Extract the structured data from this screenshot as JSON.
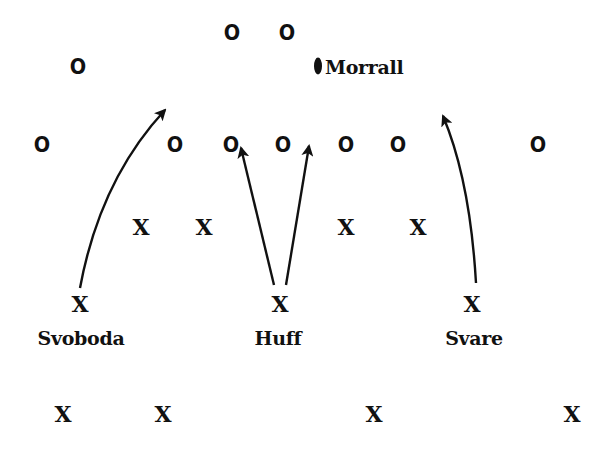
{
  "diagram": {
    "type": "football play diagram",
    "colors": {
      "ink": "#111111",
      "background": "#ffffff"
    },
    "offense_symbol": "O",
    "defense_symbol": "X",
    "offense": [
      {
        "id": "o1",
        "symbol": "O",
        "x": 232,
        "y": 33
      },
      {
        "id": "o2",
        "symbol": "O",
        "x": 287,
        "y": 33
      },
      {
        "id": "o3",
        "symbol": "O",
        "x": 78,
        "y": 67
      },
      {
        "id": "o4",
        "symbol": "O",
        "x": 42,
        "y": 145
      },
      {
        "id": "o5",
        "symbol": "O",
        "x": 175,
        "y": 145
      },
      {
        "id": "o6",
        "symbol": "O",
        "x": 231,
        "y": 145
      },
      {
        "id": "o7",
        "symbol": "O",
        "x": 283,
        "y": 145
      },
      {
        "id": "o8",
        "symbol": "O",
        "x": 346,
        "y": 145
      },
      {
        "id": "o9",
        "symbol": "O",
        "x": 398,
        "y": 145
      },
      {
        "id": "o10",
        "symbol": "O",
        "x": 538,
        "y": 145
      }
    ],
    "quarterback": {
      "name": "Morrall",
      "icon": "football-icon",
      "ball_x": 318,
      "ball_y": 66,
      "label_x": 326,
      "label_y": 66
    },
    "defense": [
      {
        "id": "x1",
        "symbol": "X",
        "x": 141,
        "y": 227
      },
      {
        "id": "x2",
        "symbol": "X",
        "x": 204,
        "y": 227
      },
      {
        "id": "x3",
        "symbol": "X",
        "x": 346,
        "y": 227
      },
      {
        "id": "x4",
        "symbol": "X",
        "x": 418,
        "y": 227
      },
      {
        "id": "x5",
        "symbol": "X",
        "x": 80,
        "y": 304,
        "label": "Svoboda",
        "label_y": 338
      },
      {
        "id": "x6",
        "symbol": "X",
        "x": 280,
        "y": 304,
        "label": "Huff",
        "label_y": 338
      },
      {
        "id": "x7",
        "symbol": "X",
        "x": 472,
        "y": 304,
        "label": "Svare",
        "label_y": 338
      },
      {
        "id": "x8",
        "symbol": "X",
        "x": 63,
        "y": 414
      },
      {
        "id": "x9",
        "symbol": "X",
        "x": 163,
        "y": 414
      },
      {
        "id": "x10",
        "symbol": "X",
        "x": 374,
        "y": 414
      },
      {
        "id": "x11",
        "symbol": "X",
        "x": 572,
        "y": 414
      }
    ],
    "labels": {
      "svoboda": "Svoboda",
      "huff": "Huff",
      "svare": "Svare",
      "morrall": "Morrall"
    },
    "arrows": [
      {
        "id": "svoboda-route",
        "from": "Svoboda",
        "path": "M 80 288 Q 100 180 165 110"
      },
      {
        "id": "huff-left-route",
        "from": "Huff",
        "path": "M 274 285 L 241 148"
      },
      {
        "id": "huff-right-route",
        "from": "Huff",
        "path": "M 286 285 L 309 146"
      },
      {
        "id": "svare-route",
        "from": "Svare",
        "path": "M 476 283 Q 470 180 443 116"
      }
    ]
  }
}
